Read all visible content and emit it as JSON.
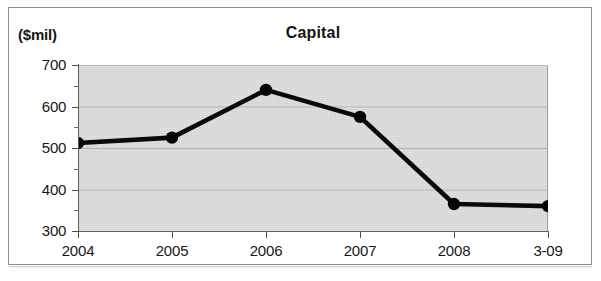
{
  "chart_data": {
    "type": "line",
    "title": "Capital",
    "unit_label": "($mil)",
    "xlabel": "",
    "ylabel": "($mil)",
    "categories": [
      "2004",
      "2005",
      "2006",
      "2007",
      "2008",
      "3-09"
    ],
    "values": [
      512,
      525,
      640,
      575,
      365,
      360
    ],
    "series": [
      {
        "name": "Capital",
        "values": [
          512,
          525,
          640,
          575,
          365,
          360
        ]
      }
    ],
    "ylim": [
      300,
      700
    ],
    "yticks": [
      300,
      400,
      500,
      600,
      700
    ],
    "ytick_labels": [
      "300",
      "400",
      "500",
      "600",
      "700"
    ],
    "yminor_ticks": [
      350,
      450,
      550,
      650
    ],
    "grid": true,
    "legend": "none",
    "marker": "circle-filled",
    "line_color": "#000000",
    "marker_color": "#000000",
    "plot_background": "#d2d2d2",
    "page_background": "#ffffff",
    "frame_color": "#8d8d8d"
  },
  "axis": {
    "y_labels": [
      "700",
      "600",
      "500",
      "400",
      "300"
    ],
    "x_labels": [
      "2004",
      "2005",
      "2006",
      "2007",
      "2008",
      "3-09"
    ]
  }
}
